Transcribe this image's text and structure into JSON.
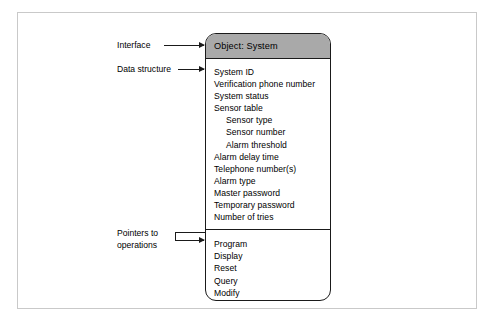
{
  "diagram": {
    "object_box": {
      "header_title": "Object: System",
      "header_color": "#a9a9a9",
      "attributes": [
        {
          "label": "System ID",
          "indent": 0
        },
        {
          "label": "Verification phone number",
          "indent": 0
        },
        {
          "label": "System status",
          "indent": 0
        },
        {
          "label": "Sensor table",
          "indent": 0
        },
        {
          "label": "Sensor type",
          "indent": 1
        },
        {
          "label": "Sensor number",
          "indent": 1
        },
        {
          "label": "Alarm threshold",
          "indent": 1
        },
        {
          "label": "Alarm delay time",
          "indent": 0
        },
        {
          "label": "Telephone number(s)",
          "indent": 0
        },
        {
          "label": "Alarm type",
          "indent": 0
        },
        {
          "label": "Master password",
          "indent": 0
        },
        {
          "label": "Temporary password",
          "indent": 0
        },
        {
          "label": "Number of tries",
          "indent": 0
        }
      ],
      "operations": [
        {
          "label": "Program"
        },
        {
          "label": "Display"
        },
        {
          "label": "Reset"
        },
        {
          "label": "Query"
        },
        {
          "label": "Modify"
        },
        {
          "label": "Call"
        }
      ]
    },
    "annotations": {
      "interface": "Interface",
      "data_structure": "Data structure",
      "pointers_line1": "Pointers to",
      "pointers_line2": "operations"
    }
  }
}
